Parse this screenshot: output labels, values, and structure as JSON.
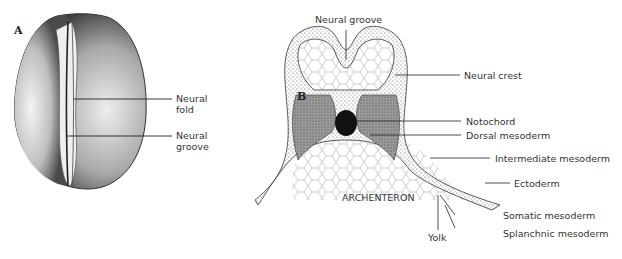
{
  "figure": {
    "panels": [
      {
        "id": "A",
        "label": "A",
        "description": "Dorsal view of embryo showing neural plate",
        "annotations": [
          {
            "text_line1": "Neural",
            "text_line2": "fold"
          },
          {
            "text_line1": "Neural",
            "text_line2": "groove"
          }
        ]
      },
      {
        "id": "B",
        "label": "B",
        "description": "Transverse section through neurula",
        "annotations": [
          {
            "text": "Neural groove"
          },
          {
            "text": "Neural crest"
          },
          {
            "text": "Notochord"
          },
          {
            "text": "Dorsal mesoderm"
          },
          {
            "text": "Intermediate mesoderm"
          },
          {
            "text": "Ectoderm"
          },
          {
            "text": "ARCHENTERON"
          },
          {
            "text": "Yolk"
          },
          {
            "text": "Somatic mesoderm"
          },
          {
            "text": "Splanchnic mesoderm"
          }
        ]
      }
    ],
    "colors": {
      "ink": "#222222",
      "mesoderm": "#8a8a8a",
      "notochord": "#111111",
      "background": "#ffffff"
    }
  }
}
